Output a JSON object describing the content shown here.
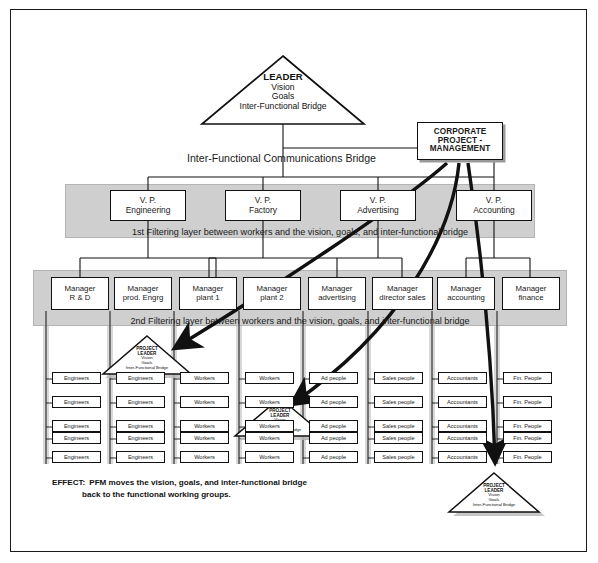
{
  "diagram": {
    "title_leader": {
      "line1": "LEADER",
      "line2": "Vision",
      "line3": "Goals",
      "line4": "Inter-Functional Bridge"
    },
    "corporate_box": {
      "line1": "CORPORATE",
      "line2": "PROJECT -",
      "line3": "MANAGEMENT"
    },
    "bridge_label": "Inter-Functional Communications Bridge",
    "filter_band_1": "1st Filtering layer between workers and the vision, goals, and inter-functional bridge",
    "filter_band_2": "2nd Filtering layer between workers and the vision, goals, and inter-functional bridge",
    "vps": [
      {
        "line1": "V. P.",
        "line2": "Engineering"
      },
      {
        "line1": "V. P.",
        "line2": "Factory"
      },
      {
        "line1": "V. P.",
        "line2": "Advertising"
      },
      {
        "line1": "V. P.",
        "line2": "Accounting"
      }
    ],
    "managers": [
      {
        "line1": "Manager",
        "line2": "R & D"
      },
      {
        "line1": "Manager",
        "line2": "prod. Engrg"
      },
      {
        "line1": "Manager",
        "line2": "plant 1"
      },
      {
        "line1": "Manager",
        "line2": "plant 2"
      },
      {
        "line1": "Manager",
        "line2": "advertising"
      },
      {
        "line1": "Manager",
        "line2": "director sales"
      },
      {
        "line1": "Manager",
        "line2": "accounting"
      },
      {
        "line1": "Manager",
        "line2": "finance"
      }
    ],
    "worker_columns": [
      {
        "label": "Engineers",
        "count": 5
      },
      {
        "label": "Engineers",
        "count": 5
      },
      {
        "label": "Workers",
        "count": 5
      },
      {
        "label": "Workers",
        "count": 5
      },
      {
        "label": "Ad people",
        "count": 5
      },
      {
        "label": "Sales people",
        "count": 5
      },
      {
        "label": "Accountants",
        "count": 5
      },
      {
        "label": "Fin. People",
        "count": 5
      }
    ],
    "project_leader_triangles": [
      {
        "line1": "PROJECT",
        "line2": "LEADER",
        "line3": "Vision",
        "line4": "Goals",
        "line5": "Inter-Functional Bridge"
      },
      {
        "line1": "PROJECT",
        "line2": "LEADER",
        "line3": "Vision",
        "line4": "Goals",
        "line5": "Inter-Functional Bridge"
      },
      {
        "line1": "PROJECT",
        "line2": "LEADER",
        "line3": "Vision",
        "line4": "Goals",
        "line5": "Inter-Functional Bridge"
      }
    ],
    "effect": {
      "lead": "EFFECT:",
      "line1": "PFM moves the vision, goals, and inter-functional bridge",
      "line2": "back to the functional working groups."
    },
    "colors": {
      "band_gray": "#cfcfcf",
      "column_gray": "#d8d8d8",
      "line_black": "#111111",
      "shadow_gray": "#9a9a9a",
      "page_white": "#ffffff"
    }
  }
}
